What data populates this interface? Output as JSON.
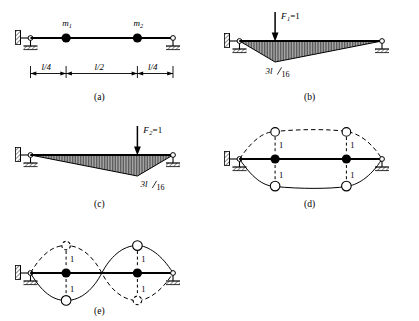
{
  "figure": {
    "background_color": "#ffffff",
    "line_color": "#000000",
    "fill_color": "#8c8c8c"
  },
  "panels": [
    {
      "id": "a",
      "label": "(a)",
      "caption": "Beam with two lumped masses",
      "masses": [
        {
          "name": "mass-1",
          "label": "m",
          "subscript": "1",
          "position_fraction": 0.25
        },
        {
          "name": "mass-2",
          "label": "m",
          "subscript": "2",
          "position_fraction": 0.75
        }
      ],
      "dimensions": [
        {
          "name": "dim-left",
          "label": "l/4",
          "numerator": "l",
          "denominator": "4"
        },
        {
          "name": "dim-middle",
          "label": "l/2",
          "numerator": "l",
          "denominator": "2"
        },
        {
          "name": "dim-right",
          "label": "l/4",
          "numerator": "l",
          "denominator": "4"
        }
      ],
      "supports": {
        "left": "pin",
        "right": "roller"
      }
    },
    {
      "id": "b",
      "label": "(b)",
      "caption": "Bending moment diagram for unit load at mass 1",
      "load": {
        "name": "load-F1",
        "label": "F",
        "subscript": "1",
        "value": "=1",
        "position_fraction": 0.25,
        "direction": "down"
      },
      "peak": {
        "name": "peak-value-b",
        "numerator": "3l",
        "denominator": "16",
        "label": "3l/16",
        "position_fraction": 0.25
      },
      "supports": {
        "left": "pin",
        "right": "roller"
      }
    },
    {
      "id": "c",
      "label": "(c)",
      "caption": "Bending moment diagram for unit load at mass 2",
      "load": {
        "name": "load-F2",
        "label": "F",
        "subscript": "2",
        "value": "=1",
        "position_fraction": 0.75,
        "direction": "down"
      },
      "peak": {
        "name": "peak-value-c",
        "numerator": "3l",
        "denominator": "16",
        "label": "3l/16",
        "position_fraction": 0.75
      },
      "supports": {
        "left": "pin",
        "right": "roller"
      }
    },
    {
      "id": "d",
      "label": "(d)",
      "caption": "First mode shape - symmetric, masses in phase",
      "mode_number": 1,
      "amplitude_labels": [
        {
          "name": "amp-d-1-up",
          "label": "1"
        },
        {
          "name": "amp-d-1-down",
          "label": "1"
        },
        {
          "name": "amp-d-2-up",
          "label": "1"
        },
        {
          "name": "amp-d-2-down",
          "label": "1"
        }
      ],
      "supports": {
        "left": "pin",
        "right": "roller"
      }
    },
    {
      "id": "e",
      "label": "(e)",
      "caption": "Second mode shape - antisymmetric, masses out of phase",
      "mode_number": 2,
      "amplitude_labels": [
        {
          "name": "amp-e-1-up",
          "label": "1"
        },
        {
          "name": "amp-e-1-down",
          "label": "1"
        },
        {
          "name": "amp-e-2-up",
          "label": "1"
        },
        {
          "name": "amp-e-2-down",
          "label": "1"
        }
      ],
      "supports": {
        "left": "pin",
        "right": "roller"
      }
    }
  ]
}
